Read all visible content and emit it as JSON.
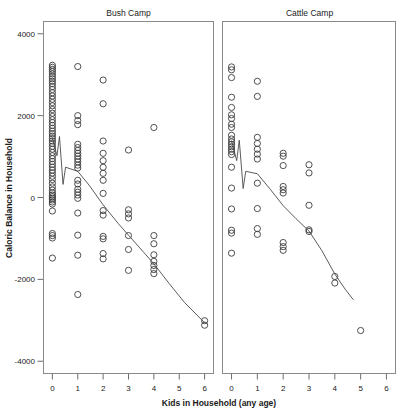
{
  "chart_data": {
    "type": "scatter",
    "title": "",
    "xlabel": "Kids in Household (any age)",
    "ylabel": "Caloric Balance in Household",
    "xlim": [
      -0.35,
      6.35
    ],
    "ylim": [
      -4300,
      4300
    ],
    "grid": false,
    "legend": false,
    "xticks": [
      "0",
      "1",
      "2",
      "3",
      "4",
      "5",
      "6"
    ],
    "xtick_values": [
      0,
      1,
      2,
      3,
      4,
      5,
      6
    ],
    "yticks": [
      "4000",
      "2000",
      "0",
      "-2000",
      "-4000"
    ],
    "ytick_values": [
      4000,
      2000,
      0,
      -2000,
      -4000
    ],
    "marker": "open-circle",
    "panels": [
      {
        "label": "Bush Camp",
        "points": [
          [
            0,
            3230
          ],
          [
            0,
            3180
          ],
          [
            0,
            3130
          ],
          [
            0,
            3080
          ],
          [
            0,
            3020
          ],
          [
            0,
            2960
          ],
          [
            0,
            2900
          ],
          [
            0,
            2840
          ],
          [
            0,
            2780
          ],
          [
            0,
            2710
          ],
          [
            0,
            2640
          ],
          [
            0,
            2560
          ],
          [
            0,
            2480
          ],
          [
            0,
            2400
          ],
          [
            0,
            2320
          ],
          [
            0,
            2240
          ],
          [
            0,
            2150
          ],
          [
            0,
            2060
          ],
          [
            0,
            1980
          ],
          [
            0,
            1900
          ],
          [
            0,
            1830
          ],
          [
            0,
            1760
          ],
          [
            0,
            1690
          ],
          [
            0,
            1620
          ],
          [
            0,
            1560
          ],
          [
            0,
            1500
          ],
          [
            0,
            1440
          ],
          [
            0,
            1380
          ],
          [
            0,
            1320
          ],
          [
            0,
            1250
          ],
          [
            0,
            1180
          ],
          [
            0,
            1100
          ],
          [
            0,
            1020
          ],
          [
            0,
            950
          ],
          [
            0,
            880
          ],
          [
            0,
            810
          ],
          [
            0,
            740
          ],
          [
            0,
            670
          ],
          [
            0,
            600
          ],
          [
            0,
            520
          ],
          [
            0,
            440
          ],
          [
            0,
            350
          ],
          [
            0,
            260
          ],
          [
            0,
            180
          ],
          [
            0,
            110
          ],
          [
            0,
            60
          ],
          [
            0,
            20
          ],
          [
            0,
            -20
          ],
          [
            0,
            -60
          ],
          [
            0,
            -110
          ],
          [
            0,
            -160
          ],
          [
            0,
            -330
          ],
          [
            0,
            -880
          ],
          [
            0,
            -930
          ],
          [
            0,
            -990
          ],
          [
            0,
            -1480
          ],
          [
            1,
            3200
          ],
          [
            1,
            2000
          ],
          [
            1,
            1880
          ],
          [
            1,
            1780
          ],
          [
            1,
            1300
          ],
          [
            1,
            1220
          ],
          [
            1,
            1150
          ],
          [
            1,
            1080
          ],
          [
            1,
            1010
          ],
          [
            1,
            940
          ],
          [
            1,
            870
          ],
          [
            1,
            790
          ],
          [
            1,
            720
          ],
          [
            1,
            420
          ],
          [
            1,
            330
          ],
          [
            1,
            200
          ],
          [
            1,
            130
          ],
          [
            1,
            60
          ],
          [
            1,
            -20
          ],
          [
            1,
            -380
          ],
          [
            1,
            -920
          ],
          [
            1,
            -1410
          ],
          [
            1,
            -2370
          ],
          [
            2,
            2870
          ],
          [
            2,
            2290
          ],
          [
            2,
            1380
          ],
          [
            2,
            1080
          ],
          [
            2,
            900
          ],
          [
            2,
            740
          ],
          [
            2,
            590
          ],
          [
            2,
            420
          ],
          [
            2,
            100
          ],
          [
            2,
            -320
          ],
          [
            2,
            -430
          ],
          [
            2,
            -950
          ],
          [
            2,
            -1010
          ],
          [
            2,
            -1370
          ],
          [
            2,
            -1500
          ],
          [
            3,
            1160
          ],
          [
            3,
            -300
          ],
          [
            3,
            -400
          ],
          [
            3,
            -500
          ],
          [
            3,
            -930
          ],
          [
            3,
            -1270
          ],
          [
            3,
            -1780
          ],
          [
            4,
            1710
          ],
          [
            4,
            -930
          ],
          [
            4,
            -1130
          ],
          [
            4,
            -1400
          ],
          [
            4,
            -1560
          ],
          [
            4,
            -1660
          ],
          [
            4,
            -1760
          ],
          [
            4,
            -1860
          ],
          [
            6,
            -3010
          ],
          [
            6,
            -3120
          ]
        ],
        "trend": [
          [
            0,
            1460
          ],
          [
            0.18,
            1020
          ],
          [
            0.28,
            1490
          ],
          [
            0.42,
            320
          ],
          [
            0.52,
            740
          ],
          [
            1.0,
            640
          ],
          [
            1.45,
            300
          ],
          [
            2.0,
            -180
          ],
          [
            2.6,
            -640
          ],
          [
            3.0,
            -920
          ],
          [
            3.6,
            -1340
          ],
          [
            4.0,
            -1620
          ],
          [
            4.6,
            -2100
          ],
          [
            5.2,
            -2560
          ],
          [
            6.0,
            -3060
          ]
        ]
      },
      {
        "label": "Cattle Camp",
        "points": [
          [
            0,
            3190
          ],
          [
            0,
            3120
          ],
          [
            0,
            2930
          ],
          [
            0,
            2450
          ],
          [
            0,
            2200
          ],
          [
            0,
            2020
          ],
          [
            0,
            1930
          ],
          [
            0,
            1790
          ],
          [
            0,
            1710
          ],
          [
            0,
            1520
          ],
          [
            0,
            1430
          ],
          [
            0,
            1360
          ],
          [
            0,
            1300
          ],
          [
            0,
            1240
          ],
          [
            0,
            1180
          ],
          [
            0,
            1120
          ],
          [
            0,
            1050
          ],
          [
            0,
            740
          ],
          [
            0,
            230
          ],
          [
            0,
            -280
          ],
          [
            0,
            -800
          ],
          [
            0,
            -870
          ],
          [
            0,
            -1360
          ],
          [
            1,
            2840
          ],
          [
            1,
            2470
          ],
          [
            1,
            1470
          ],
          [
            1,
            1320
          ],
          [
            1,
            1180
          ],
          [
            1,
            1060
          ],
          [
            1,
            940
          ],
          [
            1,
            350
          ],
          [
            1,
            -270
          ],
          [
            1,
            -760
          ],
          [
            1,
            -900
          ],
          [
            2,
            1080
          ],
          [
            2,
            1010
          ],
          [
            2,
            780
          ],
          [
            2,
            270
          ],
          [
            2,
            190
          ],
          [
            2,
            110
          ],
          [
            2,
            -1100
          ],
          [
            2,
            -1200
          ],
          [
            2,
            -1290
          ],
          [
            3,
            800
          ],
          [
            3,
            600
          ],
          [
            3,
            -190
          ],
          [
            3,
            -790
          ],
          [
            3,
            -830
          ],
          [
            4,
            -1930
          ],
          [
            4,
            -2090
          ],
          [
            5,
            -3250
          ]
        ],
        "trend": [
          [
            0,
            1390
          ],
          [
            0.2,
            900
          ],
          [
            0.3,
            1400
          ],
          [
            0.45,
            220
          ],
          [
            0.55,
            640
          ],
          [
            1.0,
            580
          ],
          [
            1.5,
            200
          ],
          [
            2.0,
            -200
          ],
          [
            2.5,
            -520
          ],
          [
            3.0,
            -820
          ],
          [
            3.5,
            -1300
          ],
          [
            4.0,
            -1870
          ],
          [
            4.4,
            -2240
          ],
          [
            4.72,
            -2500
          ]
        ]
      }
    ]
  }
}
